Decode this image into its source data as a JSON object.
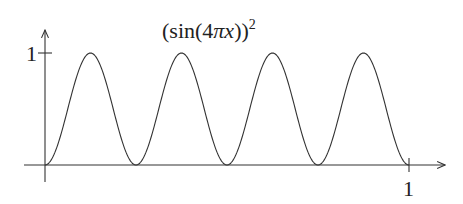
{
  "chart_data": {
    "type": "line",
    "title_parts": {
      "main": "(sin(4",
      "pi": "π",
      "var": "x",
      "close": "))",
      "sup": "2"
    },
    "xlabel": "",
    "ylabel": "",
    "xlim": [
      0,
      1
    ],
    "ylim": [
      0,
      1
    ],
    "x_ticks": [
      {
        "value": 1,
        "label": "1"
      }
    ],
    "y_ticks": [
      {
        "value": 1,
        "label": "1"
      }
    ],
    "grid": false,
    "legend": null,
    "function": "(sin(4*pi*x))^2",
    "series": [
      {
        "name": "(sin(4πx))²",
        "x": [
          0,
          0.0625,
          0.125,
          0.1875,
          0.25,
          0.3125,
          0.375,
          0.4375,
          0.5,
          0.5625,
          0.625,
          0.6875,
          0.75,
          0.8125,
          0.875,
          0.9375,
          1
        ],
        "y": [
          0,
          0.5,
          1,
          0.5,
          0,
          0.5,
          1,
          0.5,
          0,
          0.5,
          1,
          0.5,
          0,
          0.5,
          1,
          0.5,
          0
        ]
      }
    ],
    "peaks_x": [
      0.125,
      0.375,
      0.625,
      0.875
    ],
    "zeros_x": [
      0,
      0.25,
      0.5,
      0.75,
      1
    ],
    "colors": {
      "line": "#333333",
      "axis": "#333333",
      "text": "#222222"
    }
  }
}
